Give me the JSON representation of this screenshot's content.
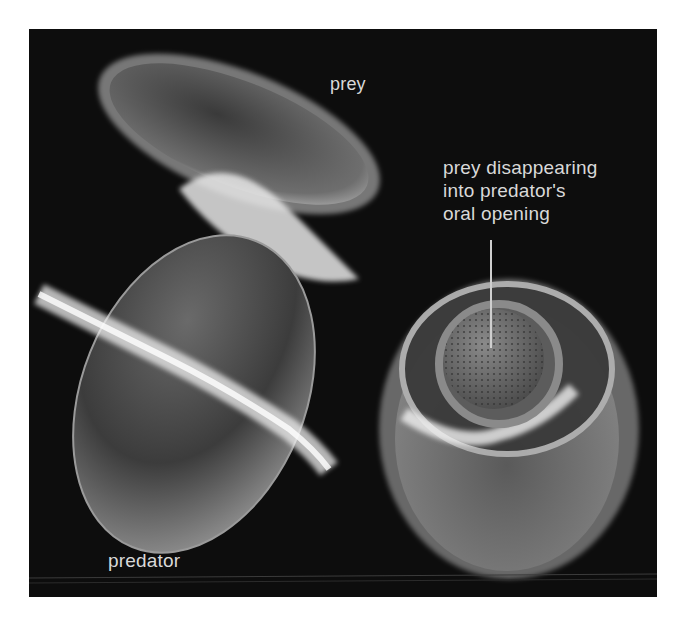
{
  "figure": {
    "background_color": "#0d0d0d",
    "label_color": "#d9d9d9",
    "labels": {
      "prey": "prey",
      "oral_opening_lines": [
        "prey disappearing",
        "into predator's",
        "oral opening"
      ],
      "predator": "predator"
    }
  }
}
